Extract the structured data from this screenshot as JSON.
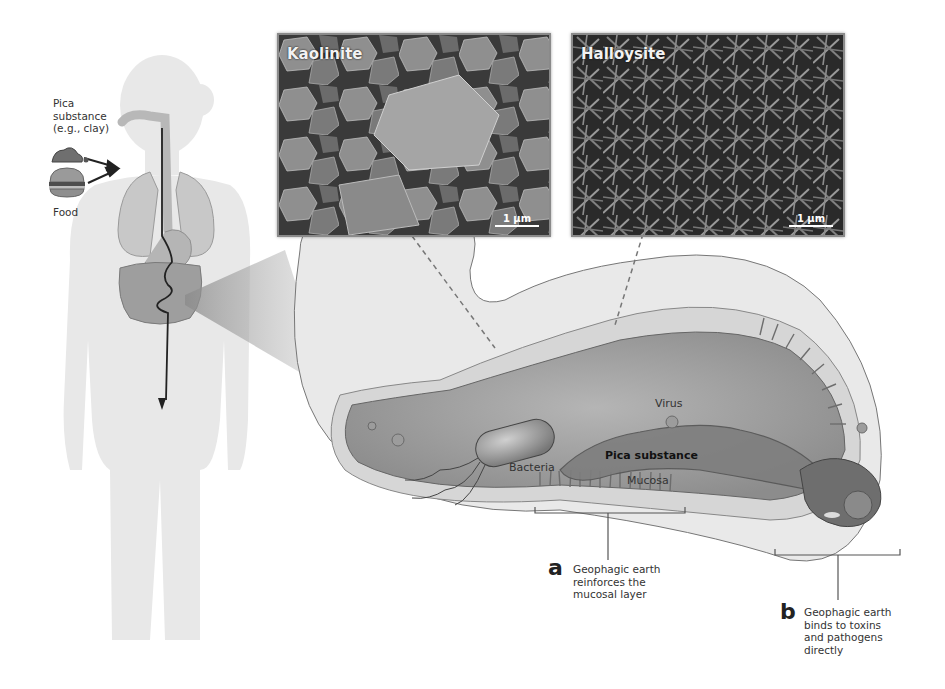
{
  "figure": {
    "kind": "scientific-diagram",
    "topic": "Geophagy / pica substance in the gastrointestinal tract"
  },
  "body_panel": {
    "pica_label": "Pica substance (e.g., clay)",
    "pica_label_lines": [
      "Pica",
      "substance",
      "(e.g., clay)"
    ],
    "food_label": "Food",
    "icons": [
      "clay-icon",
      "burger-icon",
      "arrow-icon",
      "human-silhouette-icon",
      "digestive-tract-icon"
    ]
  },
  "sem_images": [
    {
      "title": "Kaolinite",
      "scale_label": "1 µm",
      "texture": "hexagonal platelets"
    },
    {
      "title": "Halloysite",
      "scale_label": "1 µm",
      "texture": "tubular needles"
    }
  ],
  "intestine_panel": {
    "labels": {
      "virus": "Virus",
      "bacteria": "Bacteria",
      "pica_substance": "Pica substance",
      "mucosa": "Mucosa"
    }
  },
  "callouts": [
    {
      "letter": "a",
      "text_lines": [
        "Geophagic earth",
        "reinforces the",
        "mucosal layer"
      ]
    },
    {
      "letter": "b",
      "text_lines": [
        "Geophagic earth",
        "binds to toxins",
        "and pathogens",
        "directly"
      ]
    }
  ],
  "colors": {
    "silhouette": "#e6e6e6",
    "organ": "#c9c9c9",
    "organ_dark": "#9d9d9d",
    "intestine_outer": "#e8e8e8",
    "intestine_lumen": "#9a9a9a",
    "mucosa": "#b3b3b3",
    "line": "#555555",
    "sem_dark": "#2b2b2b",
    "sem_light": "#9a9a9a"
  }
}
